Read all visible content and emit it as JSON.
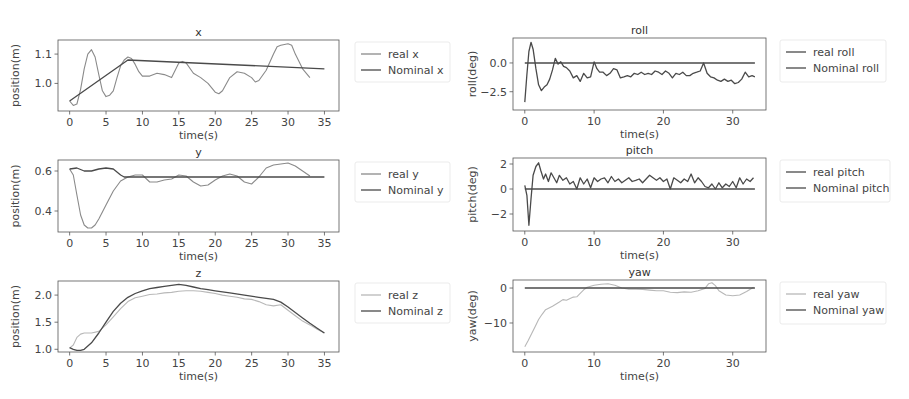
{
  "figure": {
    "width": 909,
    "height": 399,
    "colors": {
      "real": "#8a8a8a",
      "nominal": "#4a4a4a",
      "real_light": "#b8b8b8",
      "axis": "#555555",
      "legend_border": "#e6e6e6"
    }
  },
  "chart_data": [
    {
      "type": "line",
      "id": "x",
      "title": "x",
      "xlabel": "time(s)",
      "ylabel": "position(m)",
      "xlim": [
        -1.6,
        37
      ],
      "ylim": [
        0.906,
        1.148
      ],
      "xticks": [
        0,
        5,
        10,
        15,
        20,
        25,
        30,
        35
      ],
      "xtick_labels": [
        "0",
        "5",
        "10",
        "15",
        "20",
        "25",
        "30",
        "35"
      ],
      "yticks": [
        1.0,
        1.1
      ],
      "ytick_labels": [
        "1.0",
        "1.1"
      ],
      "grid": false,
      "legend_position": "outside right",
      "box": {
        "left": 58,
        "top": 40,
        "right": 339,
        "bottom": 111
      },
      "legend_box": {
        "left": 355,
        "top": 42,
        "width": 95,
        "height": 40
      },
      "series": [
        {
          "name": "real x",
          "style": "real",
          "x": [
            0,
            0.5,
            1,
            1.5,
            2,
            2.5,
            3,
            3.5,
            4,
            4.5,
            5,
            5.5,
            6,
            6.5,
            7,
            7.5,
            8,
            8.5,
            9,
            9.5,
            10,
            11,
            12,
            13,
            14,
            15,
            15.5,
            16,
            17,
            18,
            19,
            20,
            20.5,
            21,
            22,
            23,
            24,
            25,
            25.5,
            26,
            27,
            28,
            28.5,
            29,
            30,
            30.5,
            31,
            32,
            33
          ],
          "y": [
            0.94,
            0.925,
            0.93,
            0.98,
            1.05,
            1.1,
            1.115,
            1.09,
            1.03,
            0.975,
            0.955,
            0.96,
            0.975,
            1.02,
            1.06,
            1.08,
            1.09,
            1.085,
            1.065,
            1.04,
            1.025,
            1.025,
            1.035,
            1.03,
            1.02,
            1.07,
            1.075,
            1.07,
            1.035,
            1.02,
            1.0,
            0.97,
            0.965,
            0.975,
            1.02,
            1.04,
            1.035,
            1.02,
            1.005,
            1.01,
            1.045,
            1.1,
            1.125,
            1.13,
            1.135,
            1.13,
            1.1,
            1.05,
            1.02
          ]
        },
        {
          "name": "Nominal x",
          "style": "nominal",
          "x": [
            0,
            8,
            35
          ],
          "y": [
            0.94,
            1.08,
            1.05
          ]
        }
      ]
    },
    {
      "type": "line",
      "id": "y",
      "title": "y",
      "xlabel": "time(s)",
      "ylabel": "position(m)",
      "xlim": [
        -1.6,
        37
      ],
      "ylim": [
        0.295,
        0.655
      ],
      "xticks": [
        0,
        5,
        10,
        15,
        20,
        25,
        30,
        35
      ],
      "xtick_labels": [
        "0",
        "5",
        "10",
        "15",
        "20",
        "25",
        "30",
        "35"
      ],
      "yticks": [
        0.4,
        0.6
      ],
      "ytick_labels": [
        "0.4",
        "0.6"
      ],
      "grid": false,
      "legend_position": "outside right",
      "box": {
        "left": 58,
        "top": 160,
        "right": 339,
        "bottom": 232
      },
      "legend_box": {
        "left": 355,
        "top": 162,
        "width": 95,
        "height": 40
      },
      "series": [
        {
          "name": "real y",
          "style": "real",
          "x": [
            0,
            0.5,
            1,
            1.5,
            2,
            2.5,
            3,
            3.5,
            4,
            5,
            6,
            7,
            7.5,
            8,
            9,
            10,
            11,
            12,
            13,
            14,
            15,
            16,
            17,
            18,
            19,
            20,
            21,
            22,
            23,
            24,
            25,
            26,
            27,
            28,
            29,
            30,
            31,
            32,
            33
          ],
          "y": [
            0.61,
            0.58,
            0.48,
            0.38,
            0.33,
            0.315,
            0.315,
            0.33,
            0.36,
            0.43,
            0.5,
            0.55,
            0.56,
            0.57,
            0.58,
            0.58,
            0.545,
            0.545,
            0.555,
            0.56,
            0.58,
            0.575,
            0.545,
            0.525,
            0.53,
            0.555,
            0.575,
            0.585,
            0.575,
            0.545,
            0.535,
            0.57,
            0.615,
            0.63,
            0.635,
            0.64,
            0.625,
            0.6,
            0.575
          ]
        },
        {
          "name": "Nominal y",
          "style": "nominal",
          "x": [
            0,
            1,
            2,
            3,
            4,
            5,
            6,
            7,
            7.5,
            35
          ],
          "y": [
            0.61,
            0.615,
            0.6,
            0.6,
            0.61,
            0.615,
            0.61,
            0.58,
            0.57,
            0.57
          ]
        }
      ]
    },
    {
      "type": "line",
      "id": "z",
      "title": "z",
      "xlabel": "time(s)",
      "ylabel": "position(m)",
      "xlim": [
        -1.6,
        37
      ],
      "ylim": [
        0.95,
        2.26
      ],
      "xticks": [
        0,
        5,
        10,
        15,
        20,
        25,
        30,
        35
      ],
      "xtick_labels": [
        "0",
        "5",
        "10",
        "15",
        "20",
        "25",
        "30",
        "35"
      ],
      "yticks": [
        1.0,
        1.5,
        2.0
      ],
      "ytick_labels": [
        "1.0",
        "1.5",
        "2.0"
      ],
      "grid": false,
      "legend_position": "outside right",
      "box": {
        "left": 58,
        "top": 281,
        "right": 339,
        "bottom": 352
      },
      "legend_box": {
        "left": 355,
        "top": 283,
        "width": 95,
        "height": 40
      },
      "series": [
        {
          "name": "real z",
          "style": "real_light",
          "x": [
            0,
            0.5,
            1,
            1.5,
            2,
            3,
            4,
            5,
            6,
            7,
            8,
            9,
            10,
            11,
            12,
            13,
            14,
            15,
            16,
            17,
            18,
            19,
            20,
            21,
            22,
            23,
            24,
            25,
            26,
            27,
            28,
            29,
            30,
            31,
            32,
            33,
            34,
            35
          ],
          "y": [
            1.02,
            1.08,
            1.22,
            1.28,
            1.3,
            1.3,
            1.33,
            1.45,
            1.6,
            1.75,
            1.88,
            1.95,
            1.98,
            2.01,
            2.02,
            2.04,
            2.05,
            2.07,
            2.08,
            2.08,
            2.07,
            2.05,
            2.03,
            2.0,
            1.98,
            1.96,
            1.93,
            1.92,
            1.88,
            1.82,
            1.8,
            1.82,
            1.72,
            1.62,
            1.52,
            1.45,
            1.37,
            1.3
          ]
        },
        {
          "name": "Nominal z",
          "style": "nominal",
          "x": [
            0,
            0.5,
            1,
            1.5,
            2,
            3,
            4,
            5,
            6,
            7,
            8,
            9,
            10,
            11,
            12,
            13,
            14,
            15,
            16,
            17,
            18,
            19,
            20,
            22,
            24,
            26,
            28,
            29,
            30,
            31,
            32,
            33,
            34,
            35
          ],
          "y": [
            1.03,
            1.0,
            0.98,
            0.98,
            1.0,
            1.12,
            1.3,
            1.5,
            1.7,
            1.85,
            1.96,
            2.03,
            2.08,
            2.12,
            2.14,
            2.16,
            2.18,
            2.2,
            2.18,
            2.15,
            2.12,
            2.1,
            2.08,
            2.04,
            2.0,
            1.96,
            1.92,
            1.87,
            1.78,
            1.68,
            1.58,
            1.48,
            1.39,
            1.3
          ]
        }
      ]
    },
    {
      "type": "line",
      "id": "roll",
      "title": "roll",
      "xlabel": "time(s)",
      "ylabel": "roll(deg)",
      "xlim": [
        -1.7,
        34.8
      ],
      "ylim": [
        -4.09,
        2.17
      ],
      "xticks": [
        0,
        10,
        20,
        30
      ],
      "xtick_labels": [
        "0",
        "10",
        "20",
        "30"
      ],
      "yticks": [
        0.0,
        -2.5
      ],
      "ytick_labels": [
        "0.0",
        "−2.5"
      ],
      "grid": false,
      "legend_position": "outside right",
      "box": {
        "left": 513,
        "top": 38,
        "right": 766,
        "bottom": 110
      },
      "legend_box": {
        "left": 780,
        "top": 40,
        "width": 106,
        "height": 42
      },
      "series": [
        {
          "name": "real roll",
          "style": "nominal",
          "x": [
            0,
            0.3,
            0.6,
            0.9,
            1.2,
            1.6,
            2.0,
            2.4,
            2.8,
            3.2,
            3.6,
            4.0,
            4.4,
            4.8,
            5.2,
            5.6,
            6.0,
            6.5,
            7.0,
            7.5,
            8.0,
            8.5,
            9.0,
            9.5,
            10.0,
            10.4,
            10.8,
            11.3,
            11.8,
            12.3,
            12.8,
            13.3,
            13.8,
            14.3,
            14.8,
            15.3,
            15.8,
            16.3,
            16.8,
            17.3,
            17.8,
            18.3,
            18.8,
            19.3,
            19.8,
            20.3,
            20.8,
            21.3,
            21.8,
            22.3,
            22.8,
            23.3,
            23.8,
            24.3,
            24.8,
            25.3,
            25.8,
            26.3,
            26.8,
            27.3,
            27.8,
            28.3,
            28.8,
            29.3,
            29.8,
            30.3,
            30.8,
            31.3,
            31.8,
            32.3,
            32.8,
            33.2
          ],
          "y": [
            -3.4,
            -1.0,
            1.0,
            1.8,
            1.2,
            -0.5,
            -1.9,
            -2.4,
            -2.1,
            -1.9,
            -1.4,
            -0.6,
            0.4,
            -0.1,
            0.1,
            -0.3,
            -0.4,
            -0.7,
            -1.3,
            -1.1,
            -1.6,
            -0.9,
            -1.3,
            -1.2,
            0.1,
            -0.5,
            -0.8,
            -0.8,
            -1.1,
            -0.9,
            -0.5,
            -0.6,
            -1.3,
            -1.2,
            -1.1,
            -1.2,
            -0.9,
            -1.0,
            -0.8,
            -1.0,
            -0.9,
            -1.0,
            -0.7,
            -0.8,
            -1.0,
            -0.7,
            -0.9,
            -1.3,
            -0.9,
            -1.0,
            -0.8,
            -1.1,
            -1.1,
            -0.9,
            -0.8,
            -0.7,
            0.0,
            -0.9,
            -1.2,
            -1.3,
            -1.5,
            -1.6,
            -1.4,
            -1.6,
            -1.5,
            -1.8,
            -1.7,
            -1.4,
            -0.8,
            -1.2,
            -1.1,
            -1.2
          ]
        },
        {
          "name": "Nominal roll",
          "style": "nominal",
          "x": [
            0,
            33.2
          ],
          "y": [
            0.0,
            0.0
          ]
        }
      ]
    },
    {
      "type": "line",
      "id": "pitch",
      "title": "pitch",
      "xlabel": "time(s)",
      "ylabel": "pitch(deg)",
      "xlim": [
        -1.7,
        34.8
      ],
      "ylim": [
        -3.36,
        2.48
      ],
      "xticks": [
        0,
        10,
        20,
        30
      ],
      "xtick_labels": [
        "0",
        "10",
        "20",
        "30"
      ],
      "yticks": [
        2,
        0,
        -2
      ],
      "ytick_labels": [
        "2",
        "0",
        "−2"
      ],
      "grid": false,
      "legend_position": "outside right",
      "box": {
        "left": 513,
        "top": 158,
        "right": 766,
        "bottom": 231
      },
      "legend_box": {
        "left": 780,
        "top": 160,
        "width": 110,
        "height": 42
      },
      "series": [
        {
          "name": "real pitch",
          "style": "nominal",
          "x": [
            0,
            0.3,
            0.6,
            0.9,
            1.2,
            1.6,
            2.0,
            2.3,
            2.7,
            3.0,
            3.4,
            3.8,
            4.2,
            4.6,
            5.0,
            5.5,
            6.0,
            6.5,
            7.0,
            7.5,
            8.0,
            8.5,
            9.0,
            9.5,
            10.0,
            10.5,
            11.0,
            11.5,
            12.0,
            12.5,
            13.0,
            13.5,
            14.0,
            14.5,
            15.0,
            15.5,
            16.0,
            16.5,
            17.0,
            17.5,
            18.0,
            18.5,
            19.0,
            19.5,
            20.0,
            20.5,
            21.0,
            21.5,
            22.0,
            22.5,
            23.0,
            23.5,
            24.0,
            24.5,
            25.0,
            25.5,
            26.0,
            26.5,
            27.0,
            27.5,
            28.0,
            28.5,
            29.0,
            29.5,
            30.0,
            30.5,
            31.0,
            31.5,
            32.0,
            32.5,
            33.0
          ],
          "y": [
            0.3,
            -0.5,
            -2.9,
            -0.8,
            1.1,
            1.8,
            2.1,
            1.5,
            0.8,
            1.2,
            0.6,
            1.3,
            0.9,
            0.5,
            1.1,
            0.7,
            0.9,
            0.4,
            0.6,
            0.0,
            0.9,
            0.4,
            0.8,
            0.1,
            0.9,
            0.6,
            0.8,
            0.9,
            0.5,
            1.0,
            0.6,
            0.8,
            0.5,
            0.7,
            0.9,
            0.6,
            0.7,
            0.8,
            0.5,
            0.8,
            1.1,
            0.9,
            0.7,
            0.9,
            0.6,
            0.8,
            0.0,
            0.9,
            0.7,
            0.5,
            0.8,
            0.6,
            1.2,
            0.5,
            0.9,
            0.6,
            0.2,
            0.1,
            0.4,
            0.0,
            0.5,
            0.1,
            0.4,
            0.2,
            0.6,
            0.1,
            0.9,
            0.4,
            0.8,
            0.6,
            0.9
          ]
        },
        {
          "name": "Nominal pitch",
          "style": "nominal",
          "x": [
            0,
            33.2
          ],
          "y": [
            0.0,
            0.0
          ]
        }
      ]
    },
    {
      "type": "line",
      "id": "yaw",
      "title": "yaw",
      "xlabel": "time(s)",
      "ylabel": "yaw(deg)",
      "xlim": [
        -1.7,
        34.8
      ],
      "ylim": [
        -18.3,
        2.3
      ],
      "xticks": [
        0,
        10,
        20,
        30
      ],
      "xtick_labels": [
        "0",
        "10",
        "20",
        "30"
      ],
      "yticks": [
        0,
        -10
      ],
      "ytick_labels": [
        "0",
        "−10"
      ],
      "grid": false,
      "legend_position": "outside right",
      "box": {
        "left": 513,
        "top": 280,
        "right": 766,
        "bottom": 352
      },
      "legend_box": {
        "left": 780,
        "top": 282,
        "width": 106,
        "height": 42
      },
      "series": [
        {
          "name": "real yaw",
          "style": "real_light",
          "x": [
            0,
            0.5,
            1,
            1.5,
            2,
            2.5,
            3,
            4,
            5,
            5.5,
            6,
            7,
            7.5,
            8,
            8.5,
            9,
            10,
            11,
            12,
            13,
            14,
            15,
            16,
            17,
            18,
            19,
            20,
            21,
            22,
            23,
            24,
            25,
            26,
            26.5,
            27,
            27.5,
            28,
            29,
            30,
            31,
            32,
            33
          ],
          "y": [
            -16.8,
            -15,
            -13,
            -11,
            -9,
            -7.5,
            -6.2,
            -5.2,
            -4.0,
            -3.3,
            -3.5,
            -2.6,
            -2.5,
            -1.5,
            -0.5,
            0.2,
            0.8,
            1.1,
            1.2,
            0.8,
            0.0,
            -0.3,
            -0.3,
            -0.4,
            -0.6,
            -0.8,
            -0.8,
            -1.2,
            -1.3,
            -1.1,
            -1.2,
            -0.8,
            -0.1,
            1.2,
            1.5,
            0.7,
            -0.8,
            -2.0,
            -2.2,
            -2.0,
            -1.0,
            0.2
          ]
        },
        {
          "name": "Nominal yaw",
          "style": "nominal",
          "x": [
            0,
            33.2
          ],
          "y": [
            0.0,
            0.0
          ]
        }
      ]
    }
  ]
}
